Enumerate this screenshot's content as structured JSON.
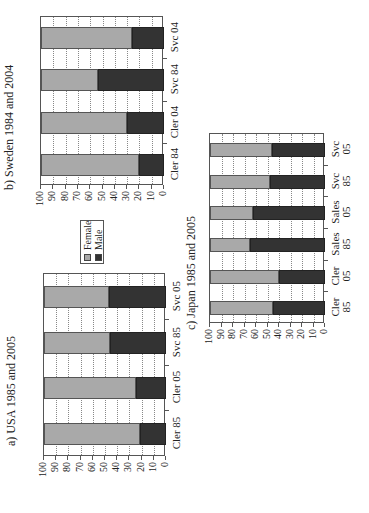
{
  "chart_data": [
    {
      "type": "bar",
      "stacked": true,
      "orientation_note": "figure rotated 90deg counter-clockwise on page",
      "title": "a) USA 1985 and 2005",
      "categories": [
        "Cler 85",
        "Cler 05",
        "Svc 85",
        "Svc 05"
      ],
      "series": [
        {
          "name": "Male",
          "values": [
            21,
            25,
            46,
            47
          ]
        },
        {
          "name": "Female",
          "values": [
            79,
            75,
            54,
            53
          ]
        }
      ],
      "xlabel": "",
      "ylabel": "",
      "ylim": [
        0,
        100
      ],
      "yticks": [
        "0",
        "10",
        "20",
        "30",
        "40",
        "50",
        "60",
        "70",
        "80",
        "90",
        "100"
      ],
      "grid": true
    },
    {
      "type": "bar",
      "stacked": true,
      "title": "b) Sweden 1984 and 2004",
      "categories": [
        "Cler 84",
        "Cler 04",
        "Svc 84",
        "Svc 04"
      ],
      "series": [
        {
          "name": "Male",
          "values": [
            20,
            30,
            54,
            26
          ]
        },
        {
          "name": "Female",
          "values": [
            80,
            70,
            46,
            74
          ]
        }
      ],
      "xlabel": "",
      "ylabel": "",
      "ylim": [
        0,
        100
      ],
      "yticks": [
        "0",
        "10",
        "20",
        "30",
        "40",
        "50",
        "60",
        "70",
        "80",
        "90",
        "100"
      ],
      "grid": true
    },
    {
      "type": "bar",
      "stacked": true,
      "title": "c) Japan 1985 and 2005",
      "categories": [
        "Cler 85",
        "Cler 05",
        "Sales 85",
        "Sales 05",
        "Svc 85",
        "Svc 05"
      ],
      "series": [
        {
          "name": "Male",
          "values": [
            45,
            40,
            65,
            63,
            48,
            46
          ]
        },
        {
          "name": "Female",
          "values": [
            55,
            60,
            35,
            37,
            52,
            54
          ]
        }
      ],
      "xlabel": "",
      "ylabel": "",
      "ylim": [
        0,
        100
      ],
      "yticks": [
        "0",
        "10",
        "20",
        "30",
        "40",
        "50",
        "60",
        "70",
        "80",
        "90",
        "100"
      ],
      "grid": true
    }
  ],
  "legend": {
    "items": [
      {
        "label": "Female",
        "color": "#a9a9a9"
      },
      {
        "label": "Male",
        "color": "#333333"
      }
    ]
  },
  "colors": {
    "female": "#a9a9a9",
    "male": "#333333"
  }
}
